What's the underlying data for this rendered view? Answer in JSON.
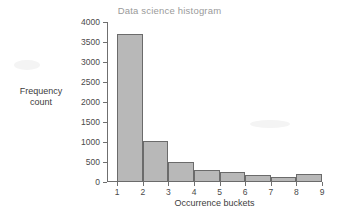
{
  "chart_data": {
    "type": "bar",
    "title": "Data science histogram",
    "xlabel": "Occurrence buckets",
    "ylabel": "Frequency count",
    "ylabel_lines": [
      "Frequency",
      "count"
    ],
    "categories": [
      "1",
      "2",
      "3",
      "4",
      "5",
      "6",
      "7",
      "8"
    ],
    "bin_edges": [
      1,
      2,
      3,
      4,
      5,
      6,
      7,
      8,
      9
    ],
    "values": [
      3700,
      1030,
      490,
      310,
      240,
      170,
      130,
      190
    ],
    "xlim": [
      0.6,
      9
    ],
    "ylim": [
      0,
      4000
    ],
    "xticks": [
      1,
      2,
      3,
      4,
      5,
      6,
      7,
      8,
      9
    ],
    "xtick_labels": [
      "1",
      "2",
      "3",
      "4",
      "5",
      "6",
      "7",
      "8",
      "9"
    ],
    "yticks": [
      0,
      500,
      1000,
      1500,
      2000,
      2500,
      3000,
      3500,
      4000
    ],
    "ytick_labels": [
      "0",
      "500",
      "1000",
      "1500",
      "2000",
      "2500",
      "3000",
      "3500",
      "4000"
    ],
    "grid": false,
    "legend": false,
    "bar_fill_color": "#b8b8b8",
    "bar_edge_color": "#6b6b6b",
    "axis_color": "#6f6f6f",
    "title_color": "#9a9a9a",
    "label_color": "#3d3d3d"
  }
}
